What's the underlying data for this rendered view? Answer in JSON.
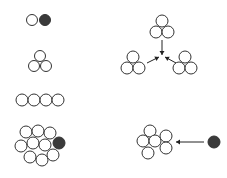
{
  "diagram": {
    "colors": {
      "open_fill": "#ffffff",
      "stroke": "#333333",
      "filled": "#3a3a3a",
      "arrow": "#222222"
    },
    "groups": [
      {
        "name": "dimer-open-filled",
        "circles": [
          {
            "cx": 32,
            "cy": 20,
            "r": 5.5,
            "filled": false
          },
          {
            "cx": 45,
            "cy": 20,
            "r": 5.5,
            "filled": true
          }
        ]
      },
      {
        "name": "trimer",
        "circles": [
          {
            "cx": 40,
            "cy": 56,
            "r": 5.5,
            "filled": false
          },
          {
            "cx": 34,
            "cy": 66,
            "r": 5.5,
            "filled": false
          },
          {
            "cx": 46,
            "cy": 66,
            "r": 5.5,
            "filled": false
          }
        ]
      },
      {
        "name": "linear-chain",
        "circles": [
          {
            "cx": 22,
            "cy": 100,
            "r": 6,
            "filled": false
          },
          {
            "cx": 34,
            "cy": 100,
            "r": 6,
            "filled": false
          },
          {
            "cx": 46,
            "cy": 100,
            "r": 6,
            "filled": false
          },
          {
            "cx": 58,
            "cy": 100,
            "r": 6,
            "filled": false
          }
        ]
      },
      {
        "name": "cluster-with-filled",
        "circles": [
          {
            "cx": 26,
            "cy": 132,
            "r": 6,
            "filled": false
          },
          {
            "cx": 38,
            "cy": 131,
            "r": 6,
            "filled": false
          },
          {
            "cx": 50,
            "cy": 133,
            "r": 6,
            "filled": false
          },
          {
            "cx": 21,
            "cy": 146,
            "r": 6,
            "filled": false
          },
          {
            "cx": 33,
            "cy": 143,
            "r": 6,
            "filled": false
          },
          {
            "cx": 45,
            "cy": 145,
            "r": 6,
            "filled": false
          },
          {
            "cx": 30,
            "cy": 157,
            "r": 6,
            "filled": false
          },
          {
            "cx": 42,
            "cy": 160,
            "r": 6,
            "filled": false
          },
          {
            "cx": 53,
            "cy": 155,
            "r": 6,
            "filled": false
          },
          {
            "cx": 59,
            "cy": 143,
            "r": 6,
            "filled": true
          }
        ]
      },
      {
        "name": "trimer-top",
        "circles": [
          {
            "cx": 162,
            "cy": 21,
            "r": 6,
            "filled": false
          },
          {
            "cx": 156,
            "cy": 32,
            "r": 6,
            "filled": false
          },
          {
            "cx": 168,
            "cy": 32,
            "r": 6,
            "filled": false
          }
        ]
      },
      {
        "name": "trimer-bottom-left",
        "circles": [
          {
            "cx": 133,
            "cy": 57,
            "r": 6,
            "filled": false
          },
          {
            "cx": 127,
            "cy": 68,
            "r": 6,
            "filled": false
          },
          {
            "cx": 139,
            "cy": 68,
            "r": 6,
            "filled": false
          }
        ]
      },
      {
        "name": "trimer-bottom-right",
        "circles": [
          {
            "cx": 185,
            "cy": 57,
            "r": 6,
            "filled": false
          },
          {
            "cx": 179,
            "cy": 68,
            "r": 6,
            "filled": false
          },
          {
            "cx": 191,
            "cy": 68,
            "r": 6,
            "filled": false
          }
        ]
      },
      {
        "name": "flower-cluster",
        "circles": [
          {
            "cx": 150,
            "cy": 131,
            "r": 6,
            "filled": false
          },
          {
            "cx": 143,
            "cy": 141,
            "r": 6,
            "filled": false
          },
          {
            "cx": 155,
            "cy": 141,
            "r": 6,
            "filled": false
          },
          {
            "cx": 166,
            "cy": 136,
            "r": 6,
            "filled": false
          },
          {
            "cx": 166,
            "cy": 148,
            "r": 6,
            "filled": false
          },
          {
            "cx": 148,
            "cy": 153,
            "r": 6,
            "filled": false
          }
        ]
      },
      {
        "name": "free-particle",
        "circles": [
          {
            "cx": 214,
            "cy": 142,
            "r": 6,
            "filled": true
          }
        ]
      }
    ],
    "arrows": [
      {
        "name": "arrow-down-from-top",
        "x1": 162,
        "y1": 40,
        "x2": 162,
        "y2": 55
      },
      {
        "name": "arrow-from-left",
        "x1": 147,
        "y1": 63,
        "x2": 159,
        "y2": 57
      },
      {
        "name": "arrow-from-right",
        "x1": 176,
        "y1": 63,
        "x2": 165,
        "y2": 57
      },
      {
        "name": "arrow-to-flower",
        "x1": 204,
        "y1": 142,
        "x2": 176,
        "y2": 142
      }
    ]
  }
}
